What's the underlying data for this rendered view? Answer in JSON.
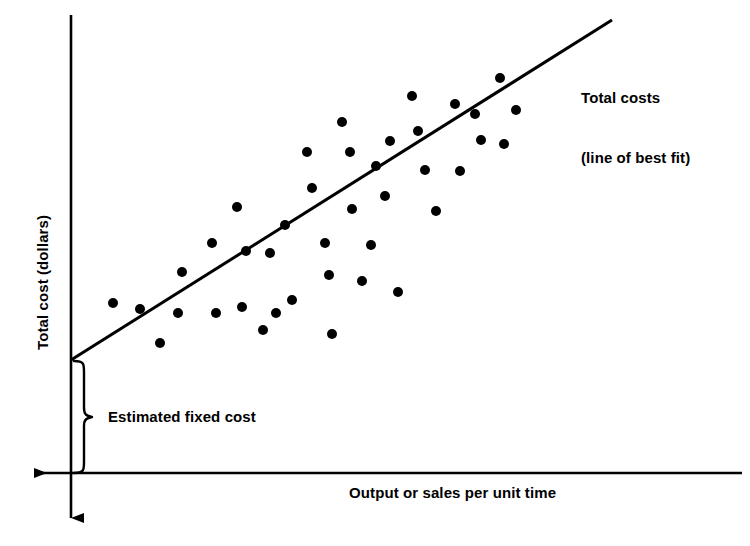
{
  "chart_data": {
    "type": "scatter",
    "title": "",
    "xlabel": "Output or sales per unit time",
    "ylabel": "Total cost (dollars)",
    "grid": false,
    "legend_position": "inline-right",
    "axis_style": {
      "x_axis_arrow": "left",
      "y_axis_arrow": "down",
      "x_axis_y_px": 473,
      "y_axis_x_px": 71,
      "origin_px": [
        71,
        473
      ]
    },
    "annotations": [
      {
        "name": "line-of-best-fit-label",
        "text": "Total costs\n(line of best fit)",
        "lines": [
          "Total costs",
          "(line of best fit)"
        ],
        "x_px": 581,
        "y_px": 48
      },
      {
        "name": "estimated-fixed-cost-label",
        "text": "Estimated fixed cost",
        "x_px": 108,
        "y_px": 407,
        "brace": {
          "x_px": 82,
          "top_px": 360,
          "bottom_px": 473,
          "direction": "right"
        }
      }
    ],
    "series": [
      {
        "name": "Total costs (line of best fit)",
        "type": "line",
        "color": "#000000",
        "intercept_label": "Estimated fixed cost",
        "points_px": [
          [
            71,
            360
          ],
          [
            612,
            20
          ]
        ]
      },
      {
        "name": "Observed cost observations",
        "type": "scatter",
        "color": "#000000",
        "marker": "circle",
        "marker_size_px": 10,
        "count": 38,
        "points_px": [
          [
            113,
            303
          ],
          [
            140,
            309
          ],
          [
            160,
            343
          ],
          [
            178,
            313
          ],
          [
            182,
            272
          ],
          [
            216,
            313
          ],
          [
            212,
            243
          ],
          [
            237,
            207
          ],
          [
            242,
            307
          ],
          [
            246,
            251
          ],
          [
            263,
            330
          ],
          [
            276,
            313
          ],
          [
            270,
            253
          ],
          [
            285,
            225
          ],
          [
            292,
            300
          ],
          [
            307,
            152
          ],
          [
            312,
            188
          ],
          [
            325,
            243
          ],
          [
            329,
            275
          ],
          [
            332,
            334
          ],
          [
            342,
            122
          ],
          [
            350,
            152
          ],
          [
            352,
            209
          ],
          [
            362,
            281
          ],
          [
            371,
            245
          ],
          [
            376,
            166
          ],
          [
            385,
            196
          ],
          [
            390,
            141
          ],
          [
            398,
            292
          ],
          [
            412,
            96
          ],
          [
            418,
            131
          ],
          [
            425,
            170
          ],
          [
            436,
            211
          ],
          [
            455,
            104
          ],
          [
            460,
            171
          ],
          [
            475,
            114
          ],
          [
            481,
            140
          ],
          [
            500,
            78
          ],
          [
            504,
            144
          ],
          [
            516,
            110
          ]
        ]
      }
    ]
  },
  "labels": {
    "y_axis": "Total cost (dollars)",
    "x_axis": "Output or sales per unit time",
    "series_line_1": "Total costs",
    "series_line_2": "(line of best fit)",
    "fixed_cost": "Estimated fixed cost"
  },
  "colors": {
    "ink": "#000000",
    "background": "#ffffff"
  }
}
